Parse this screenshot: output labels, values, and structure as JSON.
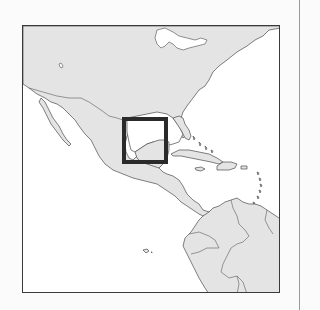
{
  "map": {
    "type": "locator-map",
    "region_shown": "North America, Central America, Caribbean and northern South America",
    "highlight": {
      "label": "Yucatán Peninsula",
      "box": {
        "x": 121,
        "y": 116,
        "width": 46,
        "height": 47
      },
      "stroke_color": "#2a2a2a"
    },
    "colors": {
      "land": "#e4e4e4",
      "water": "#ffffff",
      "coastline": "#4a4a4a",
      "frame": "#3a3a3a",
      "page_background": "#fbfbfb"
    },
    "features": [
      "United States",
      "Mexico",
      "Central America",
      "Cuba",
      "Hispaniola",
      "Jamaica",
      "Puerto Rico",
      "Lesser Antilles",
      "Colombia",
      "Venezuela",
      "Ecuador",
      "Peru",
      "Brazil",
      "Galápagos Islands",
      "Great Lakes"
    ]
  }
}
